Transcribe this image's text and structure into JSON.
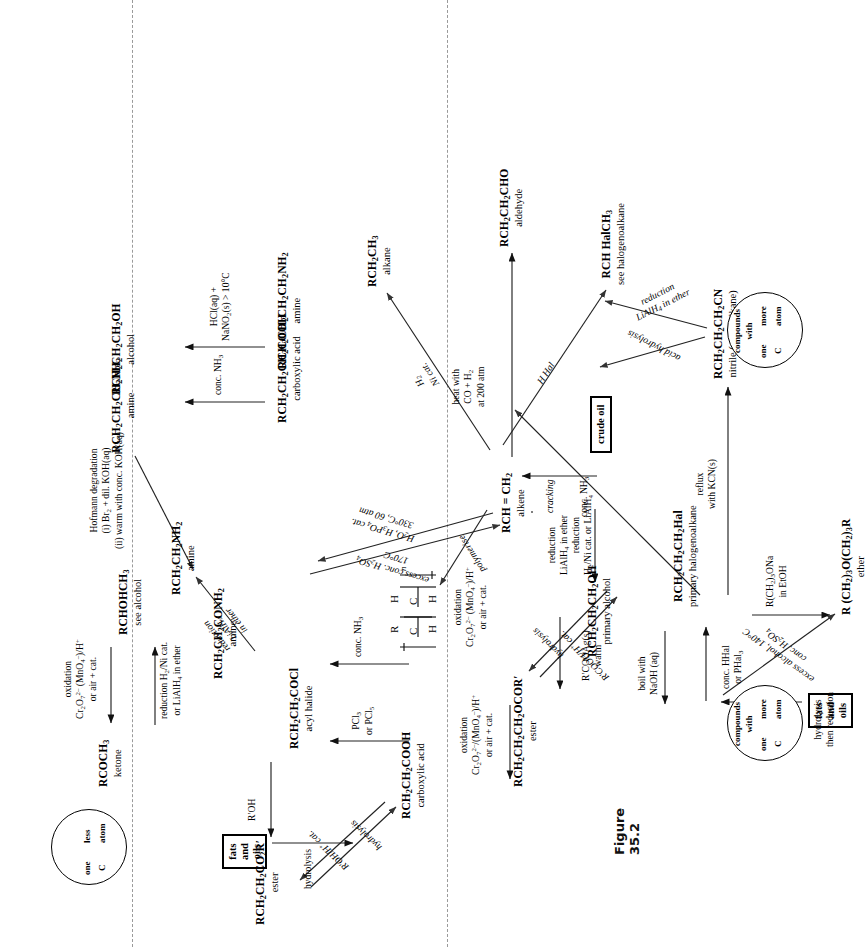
{
  "figure": {
    "caption": "Figure 35.2"
  },
  "boxes": [
    {
      "id": "crude-oil",
      "label": "crude oil"
    },
    {
      "id": "fats-and-oils-top",
      "label": "fats\nand\noils"
    },
    {
      "id": "fats-and-oils-bottom",
      "label": "fats\nand\noils"
    }
  ],
  "circles": [
    {
      "id": "one-more-c-left",
      "line1": "compounds",
      "line2": "with",
      "left": "one",
      "right": "more",
      "below_left": "C",
      "below_right": "atom",
      "direction": "right"
    },
    {
      "id": "one-more-c-mid",
      "line1": "compounds",
      "line2": "with",
      "left": "one",
      "right": "more",
      "below_left": "C",
      "below_right": "atom",
      "direction": "right"
    },
    {
      "id": "one-less-c",
      "line1": "",
      "line2": "",
      "left": "one",
      "right": "less",
      "below_left": "C",
      "below_right": "atom",
      "direction": "left"
    }
  ],
  "nodes": [
    {
      "id": "polymer",
      "formula": "poly",
      "name": ""
    },
    {
      "id": "ketone",
      "formula": "RCOCH<sub>3</sub>",
      "name": "ketone"
    },
    {
      "id": "secondary-alcohol",
      "formula": "RCHOHCH<sub>3</sub>",
      "name": "see alcohol"
    },
    {
      "id": "alkene",
      "formula": "RCH = CH<sub>2</sub>",
      "name": "alkene"
    },
    {
      "id": "alkane",
      "formula": "RCH<sub>2</sub>CH<sub>3</sub>",
      "name": "alkane"
    },
    {
      "id": "sec-halogenoalkane",
      "formula": "RCH HalCH<sub>3</sub>",
      "name": "see halogenoalkane"
    },
    {
      "id": "aldehyde",
      "formula": "RCH<sub>2</sub>CH<sub>2</sub>CHO",
      "name": "aldehyde"
    },
    {
      "id": "carboxylic-acid",
      "formula": "RCH<sub>2</sub>CH<sub>2</sub>COOH",
      "name": "carboxylic acid"
    },
    {
      "id": "acyl-halide",
      "formula": "RCH<sub>2</sub>CH<sub>2</sub>COCl",
      "name": "acyl halide"
    },
    {
      "id": "amide",
      "formula": "RCH<sub>2</sub>CH<sub>2</sub>CONH<sub>2</sub>",
      "name": "amine"
    },
    {
      "id": "ester-top",
      "formula": "RCH<sub>2</sub>CH<sub>2</sub>CO<sub>2</sub>R&#8242;",
      "name": "ester"
    },
    {
      "id": "amine-short",
      "formula": "RCH<sub>2</sub>CH<sub>2</sub>NH<sub>2</sub>",
      "name": "amine"
    },
    {
      "id": "amine-long",
      "formula": "RCH<sub>2</sub>CH<sub>2</sub>CH<sub>2</sub>NH<sub>2</sub>",
      "name": "amine"
    },
    {
      "id": "alcohol-long",
      "formula": "RCH<sub>2</sub>CH<sub>2</sub>CH<sub>2</sub>OH",
      "name": "alcohol"
    },
    {
      "id": "primary-alcohol",
      "formula": "RCH<sub>2</sub>CH<sub>2</sub>CH<sub>2</sub>OH",
      "name": "primary alcohol"
    },
    {
      "id": "ester-mid",
      "formula": "RCH<sub>2</sub>CH<sub>2</sub>CH<sub>2</sub>OCOR&#8242;",
      "name": "ester"
    },
    {
      "id": "primary-halogenoalkane",
      "formula": "RCH<sub>2</sub>CH<sub>2</sub>CH<sub>2</sub>Hal",
      "name": "primary halogenoalkane"
    },
    {
      "id": "ether",
      "formula": "R (CH<sub>2</sub>)<sub>3</sub>O(CH<sub>2</sub>)<sub>3</sub>R",
      "name": "ether"
    },
    {
      "id": "nitrile",
      "formula": "RCH<sub>2</sub>CH<sub>2</sub>CH<sub>2</sub>CN",
      "name": "nitrile (cyanoalkane)"
    },
    {
      "id": "acid-plus-one",
      "formula": "RCH<sub>2</sub>CH<sub>2</sub>CH<sub>2</sub>COOH",
      "name": "carboxylic acid"
    },
    {
      "id": "amine-plus-one",
      "formula": "RCH<sub>2</sub>CH<sub>2</sub>CH<sub>2</sub>CH<sub>2</sub>NH<sub>2</sub>",
      "name": "amine"
    }
  ],
  "conditions": [
    {
      "id": "cracking",
      "text": "cracking"
    },
    {
      "id": "polymerise",
      "text": "polymerise"
    },
    {
      "id": "hydration",
      "text": "H<sub>2</sub>O, H<sub>3</sub>PO<sub>4</sub> cat.\n330&#176;C, 60 atm"
    },
    {
      "id": "excess-conc-h2so4",
      "text": "excess conc. H<sub>2</sub>SO<sub>4</sub>\n170&#176;C"
    },
    {
      "id": "oxidation-ketone",
      "text": "oxidation\nCr<sub>2</sub>O<sub>7</sub><sup>2&#8211;</sup> (MnO<sub>4</sub><sup>&#8211;</sup>)/H<sup>+</sup>\nor air + cat."
    },
    {
      "id": "reduction-ketone",
      "text": "reduction H<sub>2</sub>/Ni cat.\nor LiAlH<sub>4</sub> in ether"
    },
    {
      "id": "h2-ni-cat",
      "text": "H<sub>2</sub>\nNi cat."
    },
    {
      "id": "h-hal",
      "text": "H Hal"
    },
    {
      "id": "hydroformylation",
      "text": "heat with\nCO + H<sub>2</sub>\nat 200 atm"
    },
    {
      "id": "oxidation-aldehyde",
      "text": "oxidation\nCr<sub>2</sub>O<sub>7</sub><sup>2&#8211;</sup>/(MnO<sub>4</sub><sup>&#8211;</sup>)/H<sup>+</sup>\nor air + cat."
    },
    {
      "id": "reduction-aldehyde",
      "text": "reduction\nLiAlH<sub>4</sub> in ether"
    },
    {
      "id": "hydrolysis-fats",
      "text": "hydrolysis"
    },
    {
      "id": "esterification",
      "text": "R&#8242;OH/H<sup>+</sup> cat."
    },
    {
      "id": "hydrolysis-ester",
      "text": "hydrolysis"
    },
    {
      "id": "r-oh",
      "text": "R&#8242;OH"
    },
    {
      "id": "pcl3-pcl5",
      "text": "PCl<sub>3</sub>\nor PCl<sub>5</sub>"
    },
    {
      "id": "conc-nh3-amide",
      "text": "conc. NH<sub>3</sub>"
    },
    {
      "id": "reduction-lialh4",
      "text": "reduction\nLiAlH<sub>4</sub>\nin ether"
    },
    {
      "id": "hofmann",
      "text": "Hofmann degradation\n(i) Br<sub>2</sub> + dil. KOH(aq)\n(ii) warm with conc. KOH(aq)"
    },
    {
      "id": "conc-nh3-amine-long",
      "text": "conc. NH<sub>3</sub>"
    },
    {
      "id": "hcl-nano2",
      "text": "HCl(aq) +\nNaNO<sub>2</sub>(s) &gt; 10&#176;C"
    },
    {
      "id": "reduction-oxidation-pa",
      "text": "reduction\nH<sub>2</sub>/Ni cat. or LiAlH<sub>4</sub>"
    },
    {
      "id": "oxidation-pa",
      "text": "oxidation\nCr<sub>2</sub>O<sub>7</sub><sup>2&#8211;</sup> (MnO<sub>4</sub><sup>&#8211;</sup>)/H<sup>+</sup>\nor air + cat."
    },
    {
      "id": "hydrolysis-ester-mid",
      "text": "hydrolysis"
    },
    {
      "id": "esterification-mid",
      "text": "R&#8242;COOH/H<sup>+</sup> cat."
    },
    {
      "id": "r-cooag",
      "text": "R&#8242;COOAg(s)\nwarm"
    },
    {
      "id": "boil-naoh",
      "text": "boil with\nNaOH (aq)"
    },
    {
      "id": "conc-hhal",
      "text": "conc. HHal\nor PHal<sub>3</sub>"
    },
    {
      "id": "rona-etoh",
      "text": "R(CH<sub>2</sub>)<sub>3</sub>ONa\nin  EtOH"
    },
    {
      "id": "excess-alcohol",
      "text": "excess alcohol, 140&#176;C\nconc. H<sub>2</sub>SO<sub>4</sub>"
    },
    {
      "id": "hydrolysis-then-red",
      "text": "hydrolysis\nthen reduction"
    },
    {
      "id": "conc-nh3-ester-mid",
      "text": "conc. NH<sub>3</sub>"
    },
    {
      "id": "reflux-kcn",
      "text": "reflux\nwith KCN(s)"
    },
    {
      "id": "acid-hydrolysis",
      "text": "acid hydrolysis"
    },
    {
      "id": "reduction-nitrile",
      "text": "reduction\nLiAlH<sub>4</sub> in ether"
    }
  ],
  "polymer_unit": {
    "top_left": "R",
    "bottom_left": "H",
    "top_right": "H",
    "bottom_right": "H",
    "subscript": "n"
  }
}
